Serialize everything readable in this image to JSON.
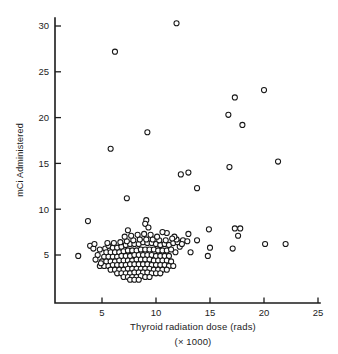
{
  "chart_data": {
    "type": "scatter",
    "title": "",
    "xlabel": "Thyroid radiation dose (rads)",
    "xlabel_sub": "(× 1000)",
    "ylabel": "mCi Administered",
    "xlim": [
      0,
      25
    ],
    "ylim": [
      0,
      32
    ],
    "grid": false,
    "legend": null,
    "xticks": [
      5,
      10,
      15,
      20,
      25
    ],
    "xtick_labels": [
      "5",
      "10",
      "15",
      "20",
      "25"
    ],
    "yticks": [
      5,
      10,
      15,
      20,
      25,
      30
    ],
    "ytick_labels": [
      "5",
      "10",
      "15",
      "20",
      "25",
      "30"
    ],
    "marker": "open-circle",
    "marker_fill": "#ffffff",
    "marker_edge": "#171717",
    "axis_color": "#1c1c1c",
    "background": "#ffffff",
    "n_points": 182,
    "points": [
      [
        11.9,
        30.3
      ],
      [
        6.2,
        27.2
      ],
      [
        20.0,
        23.0
      ],
      [
        17.3,
        22.2
      ],
      [
        16.7,
        20.3
      ],
      [
        18.0,
        19.2
      ],
      [
        9.2,
        18.4
      ],
      [
        5.8,
        16.6
      ],
      [
        21.3,
        15.2
      ],
      [
        16.8,
        14.6
      ],
      [
        13.0,
        14.0
      ],
      [
        12.3,
        13.8
      ],
      [
        13.8,
        12.3
      ],
      [
        7.3,
        11.2
      ],
      [
        3.7,
        8.7
      ],
      [
        9.1,
        8.8
      ],
      [
        9.0,
        8.4
      ],
      [
        9.3,
        8.0
      ],
      [
        7.4,
        7.7
      ],
      [
        14.9,
        7.8
      ],
      [
        17.3,
        7.9
      ],
      [
        17.8,
        7.9
      ],
      [
        17.6,
        7.1
      ],
      [
        13.0,
        7.3
      ],
      [
        12.5,
        6.6
      ],
      [
        12.9,
        6.5
      ],
      [
        13.8,
        6.6
      ],
      [
        17.1,
        5.7
      ],
      [
        15.0,
        5.8
      ],
      [
        14.8,
        4.9
      ],
      [
        13.2,
        5.3
      ],
      [
        20.1,
        6.2
      ],
      [
        22.0,
        6.2
      ],
      [
        11.8,
        5.3
      ],
      [
        3.9,
        6.0
      ],
      [
        4.2,
        5.7
      ],
      [
        4.8,
        5.6
      ],
      [
        5.3,
        5.7
      ],
      [
        2.8,
        4.9
      ],
      [
        5.6,
        6.0
      ],
      [
        6.0,
        5.8
      ],
      [
        6.4,
        5.8
      ],
      [
        6.8,
        5.9
      ],
      [
        7.2,
        6.1
      ],
      [
        7.6,
        6.2
      ],
      [
        8.0,
        6.2
      ],
      [
        8.4,
        6.2
      ],
      [
        8.8,
        6.4
      ],
      [
        9.2,
        6.3
      ],
      [
        9.6,
        6.3
      ],
      [
        10.0,
        6.2
      ],
      [
        10.4,
        6.1
      ],
      [
        10.8,
        6.2
      ],
      [
        11.2,
        6.1
      ],
      [
        11.6,
        6.3
      ],
      [
        12.0,
        6.4
      ],
      [
        11.9,
        6.7
      ],
      [
        5.4,
        5.3
      ],
      [
        5.8,
        5.3
      ],
      [
        6.2,
        5.3
      ],
      [
        6.6,
        5.3
      ],
      [
        7.0,
        5.4
      ],
      [
        7.4,
        5.5
      ],
      [
        7.8,
        5.5
      ],
      [
        8.2,
        5.5
      ],
      [
        8.6,
        5.6
      ],
      [
        9.0,
        5.6
      ],
      [
        9.4,
        5.6
      ],
      [
        9.8,
        5.6
      ],
      [
        10.2,
        5.5
      ],
      [
        10.6,
        5.5
      ],
      [
        11.0,
        5.5
      ],
      [
        11.4,
        5.6
      ],
      [
        5.2,
        4.8
      ],
      [
        5.6,
        4.8
      ],
      [
        6.0,
        4.8
      ],
      [
        6.4,
        4.8
      ],
      [
        6.8,
        4.9
      ],
      [
        7.2,
        4.9
      ],
      [
        7.6,
        4.9
      ],
      [
        8.0,
        5.0
      ],
      [
        8.4,
        5.0
      ],
      [
        8.8,
        5.0
      ],
      [
        9.2,
        5.0
      ],
      [
        9.6,
        5.0
      ],
      [
        10.0,
        4.9
      ],
      [
        10.4,
        4.9
      ],
      [
        10.8,
        4.9
      ],
      [
        11.2,
        4.9
      ],
      [
        5.0,
        4.3
      ],
      [
        5.4,
        4.3
      ],
      [
        5.8,
        4.3
      ],
      [
        6.2,
        4.3
      ],
      [
        6.6,
        4.4
      ],
      [
        7.0,
        4.4
      ],
      [
        7.4,
        4.4
      ],
      [
        7.8,
        4.4
      ],
      [
        8.2,
        4.5
      ],
      [
        8.6,
        4.5
      ],
      [
        9.0,
        4.5
      ],
      [
        9.4,
        4.5
      ],
      [
        9.8,
        4.4
      ],
      [
        10.2,
        4.4
      ],
      [
        10.6,
        4.4
      ],
      [
        11.0,
        4.4
      ],
      [
        11.4,
        4.3
      ],
      [
        4.8,
        3.8
      ],
      [
        5.2,
        3.8
      ],
      [
        5.6,
        3.8
      ],
      [
        6.0,
        3.9
      ],
      [
        6.4,
        3.9
      ],
      [
        6.8,
        3.9
      ],
      [
        7.2,
        3.9
      ],
      [
        7.6,
        4.0
      ],
      [
        8.0,
        4.0
      ],
      [
        8.4,
        4.0
      ],
      [
        8.8,
        4.0
      ],
      [
        9.2,
        4.0
      ],
      [
        9.6,
        3.9
      ],
      [
        10.0,
        3.9
      ],
      [
        10.4,
        3.9
      ],
      [
        10.8,
        3.9
      ],
      [
        11.2,
        3.8
      ],
      [
        11.6,
        3.8
      ],
      [
        5.8,
        3.4
      ],
      [
        6.2,
        3.4
      ],
      [
        6.6,
        3.4
      ],
      [
        7.0,
        3.4
      ],
      [
        7.4,
        3.5
      ],
      [
        7.8,
        3.5
      ],
      [
        8.2,
        3.5
      ],
      [
        8.6,
        3.5
      ],
      [
        9.0,
        3.5
      ],
      [
        9.4,
        3.5
      ],
      [
        9.8,
        3.4
      ],
      [
        10.2,
        3.4
      ],
      [
        10.6,
        3.4
      ],
      [
        11.0,
        3.4
      ],
      [
        6.4,
        3.0
      ],
      [
        6.8,
        3.0
      ],
      [
        7.2,
        3.0
      ],
      [
        7.6,
        3.0
      ],
      [
        8.0,
        3.1
      ],
      [
        8.4,
        3.1
      ],
      [
        8.8,
        3.1
      ],
      [
        9.2,
        3.1
      ],
      [
        9.6,
        3.0
      ],
      [
        10.0,
        3.0
      ],
      [
        10.4,
        3.0
      ],
      [
        7.0,
        2.6
      ],
      [
        7.4,
        2.6
      ],
      [
        7.8,
        2.6
      ],
      [
        8.2,
        2.6
      ],
      [
        8.6,
        2.7
      ],
      [
        9.0,
        2.6
      ],
      [
        9.4,
        2.6
      ],
      [
        7.6,
        2.3
      ],
      [
        8.0,
        2.3
      ],
      [
        8.4,
        2.3
      ],
      [
        4.6,
        5.0
      ],
      [
        4.4,
        4.5
      ],
      [
        4.9,
        4.1
      ],
      [
        4.3,
        6.2
      ],
      [
        12.2,
        5.9
      ],
      [
        12.4,
        6.2
      ],
      [
        11.7,
        7.0
      ],
      [
        11.5,
        6.8
      ],
      [
        10.9,
        6.6
      ],
      [
        10.3,
        6.6
      ],
      [
        9.7,
        6.7
      ],
      [
        9.1,
        6.7
      ],
      [
        8.5,
        6.7
      ],
      [
        7.9,
        6.6
      ],
      [
        7.3,
        6.5
      ],
      [
        6.7,
        6.4
      ],
      [
        6.1,
        6.3
      ],
      [
        5.5,
        6.3
      ],
      [
        8.3,
        7.2
      ],
      [
        8.9,
        7.3
      ],
      [
        9.5,
        7.2
      ],
      [
        10.1,
        7.0
      ],
      [
        7.7,
        7.1
      ],
      [
        7.1,
        7.0
      ],
      [
        11.0,
        7.4
      ],
      [
        10.6,
        7.5
      ]
    ]
  },
  "axes": {
    "x_axis_name": "x-axis",
    "y_axis_name": "y-axis"
  }
}
